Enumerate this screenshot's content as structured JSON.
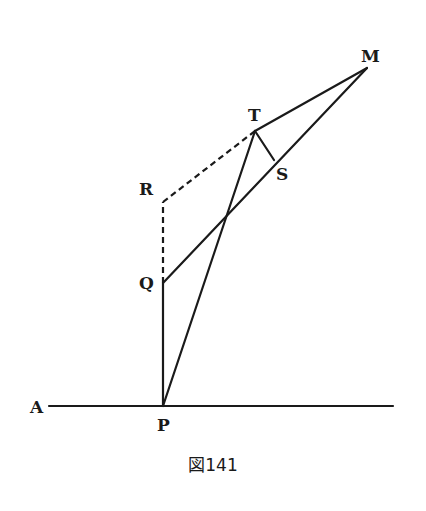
{
  "figure": {
    "caption": "図141",
    "stroke_color": "#1a1a1a",
    "background": "#ffffff",
    "points": {
      "A": {
        "label": "A",
        "x": 49,
        "y": 406,
        "label_x": 30,
        "label_y": 413
      },
      "P": {
        "label": "P",
        "x": 163,
        "y": 406,
        "label_x": 157,
        "label_y": 431
      },
      "Q": {
        "label": "Q",
        "x": 163,
        "y": 283,
        "label_x": 139,
        "label_y": 289
      },
      "R": {
        "label": "R",
        "x": 163,
        "y": 202,
        "label_x": 139,
        "label_y": 195
      },
      "T": {
        "label": "T",
        "x": 255,
        "y": 131,
        "label_x": 248,
        "label_y": 121
      },
      "S": {
        "label": "S",
        "x": 274,
        "y": 160,
        "label_x": 276,
        "label_y": 180
      },
      "M": {
        "label": "M",
        "x": 367,
        "y": 68,
        "label_x": 361,
        "label_y": 62
      }
    },
    "segments": [
      {
        "from": "A",
        "to": "end",
        "style": "solid",
        "note": "horizontal line A to right end",
        "x2": 393,
        "y2": 406
      },
      {
        "from": "P",
        "to": "Q",
        "style": "solid"
      },
      {
        "from": "Q",
        "to": "R",
        "style": "dashed"
      },
      {
        "from": "R",
        "to": "T",
        "style": "dashed"
      },
      {
        "from": "P",
        "to": "T",
        "style": "solid"
      },
      {
        "from": "T",
        "to": "M",
        "style": "solid"
      },
      {
        "from": "Q",
        "to": "M",
        "style": "solid"
      },
      {
        "from": "T",
        "to": "S",
        "style": "solid"
      }
    ]
  }
}
